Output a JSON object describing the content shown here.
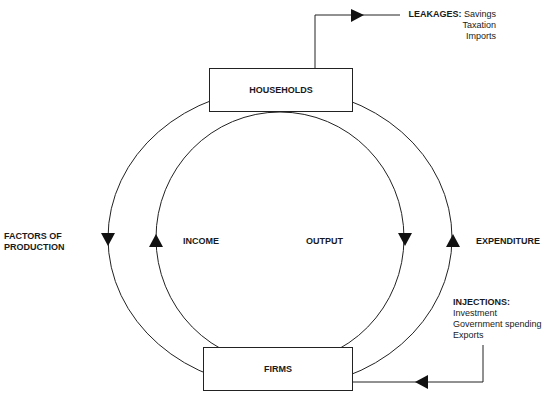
{
  "diagram": {
    "nodes": {
      "households": "HOUSEHOLDS",
      "firms": "FIRMS"
    },
    "flows": {
      "factors_of_production_line1": "FACTORS OF",
      "factors_of_production_line2": "PRODUCTION",
      "income": "INCOME",
      "output": "OUTPUT",
      "expenditure": "EXPENDITURE"
    },
    "leakages": {
      "heading": "LEAKAGES:",
      "items": [
        "Savings",
        "Taxation",
        "Imports"
      ]
    },
    "injections": {
      "heading": "INJECTIONS:",
      "items": [
        "Investment",
        "Government spending",
        "Exports"
      ]
    },
    "colors": {
      "line": "#222222",
      "text": "#1a1a1a",
      "background": "#ffffff"
    }
  }
}
